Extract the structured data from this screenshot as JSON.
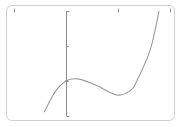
{
  "chart_data": {
    "type": "line",
    "title": "",
    "xlabel": "",
    "ylabel": "",
    "xlim": [
      -1,
      2
    ],
    "ylim": [
      -1,
      2
    ],
    "x_ticks": [
      -1,
      1,
      2
    ],
    "y_ticks": [
      -1,
      0,
      1,
      2
    ],
    "x_tick_labels": [
      "",
      "",
      ""
    ],
    "y_tick_labels": [
      "",
      "",
      "",
      ""
    ],
    "grid": false,
    "legend": "none",
    "series": [
      {
        "name": "f(x)",
        "description": "cubic with local max near x≈0.23 and local min near x≈0.98",
        "x": [
          -0.42,
          -0.21,
          0,
          0.23,
          0.56,
          0.98,
          1.25,
          1.37,
          1.62,
          1.79
        ],
        "y": [
          -0.89,
          -0.31,
          0,
          0.06,
          -0.11,
          -0.4,
          -0.26,
          0.03,
          0.89,
          2.0
        ]
      }
    ],
    "y_intercept": 0
  },
  "colors": {
    "frame": "#cfcfcf",
    "axis": "#8a8a8a",
    "curve": "#9b9b9b"
  }
}
